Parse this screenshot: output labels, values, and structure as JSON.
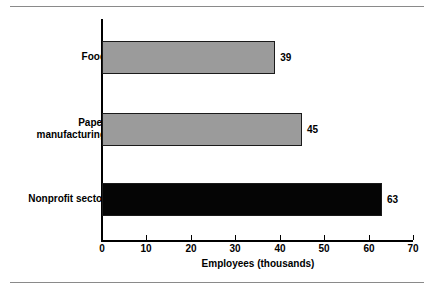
{
  "chart_data": {
    "type": "bar",
    "orientation": "horizontal",
    "title": "",
    "xlabel": "Employees (thousands)",
    "ylabel": "",
    "xlim": [
      0,
      70
    ],
    "xticks": [
      0,
      10,
      20,
      30,
      40,
      50,
      60,
      70
    ],
    "grid": false,
    "legend": null,
    "categories": [
      "Food",
      "Paper manufacturing",
      "Nonprofit sector"
    ],
    "values": [
      39,
      45,
      63
    ],
    "value_labels": [
      "39",
      "45",
      "63"
    ],
    "bar_colors": [
      "#9b9b9b",
      "#9b9b9b",
      "#050505"
    ],
    "bars": [
      {
        "category": "Food",
        "category_lines": "Food",
        "value": 39,
        "label": "39",
        "color": "#9b9b9b"
      },
      {
        "category": "Paper manufacturing",
        "category_lines": "Paper\nmanufacturing",
        "value": 45,
        "label": "45",
        "color": "#9b9b9b"
      },
      {
        "category": "Nonprofit sector",
        "category_lines": "Nonprofit sector",
        "value": 63,
        "label": "63",
        "color": "#050505"
      }
    ]
  },
  "axis": {
    "x_title": "Employees (thousands)",
    "tick_labels": [
      "0",
      "10",
      "20",
      "30",
      "40",
      "50",
      "60",
      "70"
    ]
  },
  "colors": {
    "bar_gray": "#9b9b9b",
    "bar_black": "#050505",
    "axis": "#000000",
    "rule": "#8a8a8a",
    "background": "#ffffff"
  }
}
